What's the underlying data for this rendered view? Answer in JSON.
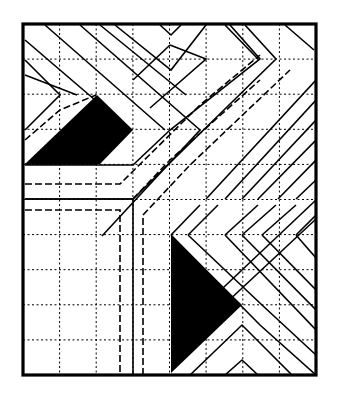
{
  "diagram": {
    "colors": {
      "background": "#ffffff",
      "ink": "#000000"
    },
    "frame": {
      "x": 23,
      "y": 24,
      "width": 293,
      "height": 351
    },
    "grid": {
      "vertical_x": [
        59.6,
        96.2,
        132.9,
        169.5,
        206.1,
        242.8,
        279.4
      ],
      "horizontal_y": [
        59.1,
        94.2,
        129.3,
        164.4,
        199.5,
        234.6,
        269.7,
        304.8,
        339.9
      ]
    },
    "filled_shapes": [
      {
        "name": "upper-left-black-trapezoid",
        "points": "25,164 97,95 133,130 100,164"
      },
      {
        "name": "lower-black-triangle",
        "points": "171,235 242,305 171,373"
      }
    ],
    "solid_paths": [
      "M25,40 L130,130 L97,164 L25,164",
      "M45,25 L165,130",
      "M80,25 L200,130 L102,236",
      "M25,60 L60,95 L25,130",
      "M25,75 L77,95",
      "M100,25 L186,95",
      "M115,25 L171,70 L206,25",
      "M160,25 L171,35 L181,25",
      "M230,25 L260,59 L170,130 L133,165 L25,165",
      "M225,25 L258,59",
      "M245,25 L276,59 L133,199 L25,199",
      "M285,25 L314,50",
      "M170,45 L206,59 L150,108",
      "M170,45 L133,80",
      "M316,80 L206,199",
      "M316,100 L225,199",
      "M316,120 L242,199",
      "M316,140 L258,199",
      "M316,160 L278,199",
      "M316,180 L296,199",
      "M25,199 L133,199 L133,375",
      "M171,235 L260,325 L316,375",
      "M188,235 L262,305 L316,355",
      "M225,235 L316,330",
      "M242,235 L316,310",
      "M262,235 L316,290",
      "M296,235 L316,258",
      "M316,200 L206,304",
      "M316,219 L225,304",
      "M190,375 L242,325 L292,375",
      "M225,375 L242,360 L258,375",
      "M171,235 L200,205",
      "M188,235 L218,205",
      "M225,235 L258,205",
      "M242,235 L276,205",
      "M262,235 L296,205",
      "M296,235 L316,215"
    ],
    "dashed_paths": [
      "M25,184 L120,184 L200,105 L260,55",
      "M25,210 L120,210 L120,375",
      "M143,375 L143,215 L190,165 L290,70",
      "M133,199 L170,160 L260,80",
      "M25,140 L60,110 L96,95"
    ]
  }
}
